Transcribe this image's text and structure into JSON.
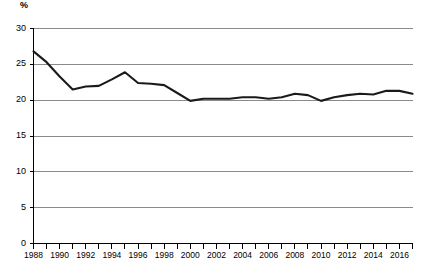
{
  "chart_data": {
    "type": "line",
    "title": "",
    "subtitle": "",
    "xlabel": "",
    "ylabel": "%",
    "ylim": [
      0,
      30
    ],
    "xlim": [
      1988,
      2017
    ],
    "grid": true,
    "legend": null,
    "y_ticks": [
      30,
      25,
      20,
      15,
      10,
      5,
      0
    ],
    "y_tick_labels": [
      "30",
      "25",
      "20",
      "15",
      "10",
      "5",
      "0"
    ],
    "x_ticks": [
      1988,
      1989,
      1990,
      1991,
      1992,
      1993,
      1994,
      1995,
      1996,
      1997,
      1998,
      1999,
      2000,
      2001,
      2002,
      2003,
      2004,
      2005,
      2006,
      2007,
      2008,
      2009,
      2010,
      2011,
      2012,
      2013,
      2014,
      2015,
      2016,
      2017
    ],
    "x_tick_labels": [
      "1988",
      "1990",
      "1992",
      "1994",
      "1996",
      "1998",
      "2000",
      "2002",
      "2004",
      "2006",
      "2008",
      "2010",
      "2012",
      "2014",
      "2016"
    ],
    "x_labeled_years": [
      1988,
      1990,
      1992,
      1994,
      1996,
      1998,
      2000,
      2002,
      2004,
      2006,
      2008,
      2010,
      2012,
      2014,
      2016
    ],
    "x": [
      1988,
      1989,
      1990,
      1991,
      1992,
      1993,
      1994,
      1995,
      1996,
      1997,
      1998,
      1999,
      2000,
      2001,
      2002,
      2003,
      2004,
      2005,
      2006,
      2007,
      2008,
      2009,
      2010,
      2011,
      2012,
      2013,
      2014,
      2015,
      2016,
      2017
    ],
    "values": [
      26.8,
      25.3,
      23.3,
      21.5,
      21.9,
      22.0,
      22.9,
      23.9,
      22.4,
      22.3,
      22.1,
      21.0,
      19.9,
      20.2,
      20.2,
      20.2,
      20.4,
      20.4,
      20.2,
      20.4,
      20.9,
      20.7,
      19.9,
      20.4,
      20.7,
      20.9,
      20.8,
      21.3,
      21.3,
      20.9
    ],
    "series": [
      {
        "name": "",
        "color": "#1a1a1a",
        "values": [
          26.8,
          25.3,
          23.3,
          21.5,
          21.9,
          22.0,
          22.9,
          23.9,
          22.4,
          22.3,
          22.1,
          21.0,
          19.9,
          20.2,
          20.2,
          20.2,
          20.4,
          20.4,
          20.2,
          20.4,
          20.9,
          20.7,
          19.9,
          20.4,
          20.7,
          20.9,
          20.8,
          21.3,
          21.3,
          20.9
        ]
      }
    ],
    "colors": {
      "line": "#1a1a1a",
      "grid": "#8a8a8a",
      "axis": "#000000",
      "background": "#ffffff"
    }
  },
  "axis": {
    "y_label": "%"
  }
}
